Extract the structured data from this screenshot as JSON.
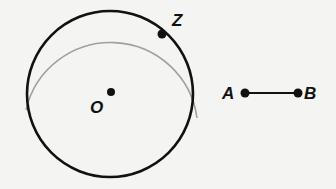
{
  "diagram": {
    "circle": {
      "center_label": "O",
      "point_on_circle_label": "Z"
    },
    "segment": {
      "start_label": "A",
      "end_label": "B"
    },
    "colors": {
      "ink": "#111111",
      "arc": "#9a9a9a",
      "background": "#f4f4f2"
    }
  }
}
